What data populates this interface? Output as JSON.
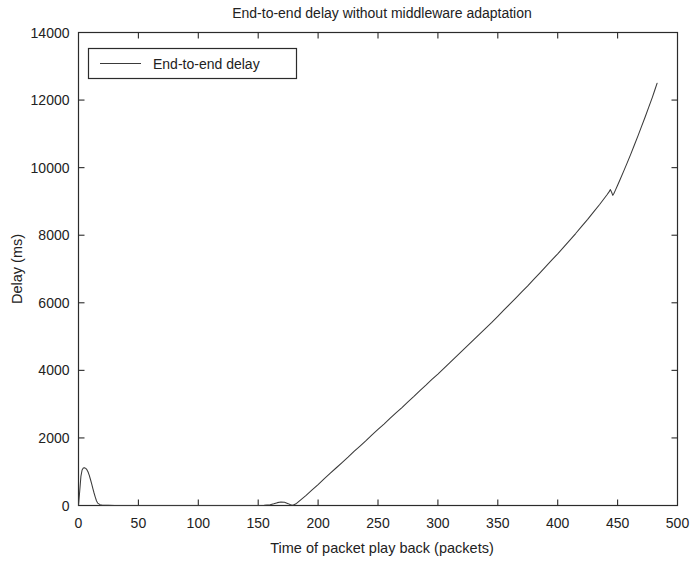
{
  "chart_data": {
    "type": "line",
    "title": "End-to-end delay without middleware adaptation",
    "xlabel": "Time of packet play back (packets)",
    "ylabel": "Delay (ms)",
    "xlim": [
      0,
      500
    ],
    "ylim": [
      0,
      14000
    ],
    "xticks": [
      0,
      50,
      100,
      150,
      200,
      250,
      300,
      350,
      400,
      450,
      500
    ],
    "yticks": [
      0,
      2000,
      4000,
      6000,
      8000,
      10000,
      12000,
      14000
    ],
    "xtick_labels": [
      "0",
      "50",
      "100",
      "150",
      "200",
      "250",
      "300",
      "350",
      "400",
      "450",
      "500"
    ],
    "ytick_labels": [
      "0",
      "2000",
      "4000",
      "6000",
      "8000",
      "10000",
      "12000",
      "14000"
    ],
    "grid": false,
    "legend_position": "upper left",
    "legend": [
      "End-to-end delay"
    ],
    "line_color": "#3a3a3a",
    "background_color": "#ffffff",
    "axis_color": "#2b2b2b",
    "series": [
      {
        "name": "End-to-end delay",
        "x": [
          0,
          1,
          2,
          3,
          4,
          5,
          6,
          7,
          8,
          9,
          10,
          11,
          12,
          13,
          14,
          15,
          16,
          18,
          20,
          25,
          30,
          40,
          50,
          60,
          70,
          80,
          90,
          100,
          110,
          120,
          130,
          140,
          150,
          155,
          160,
          163,
          166,
          169,
          172,
          175,
          177,
          179,
          182,
          186,
          190,
          195,
          200,
          205,
          210,
          215,
          220,
          225,
          230,
          235,
          240,
          245,
          250,
          255,
          260,
          265,
          270,
          275,
          280,
          285,
          290,
          295,
          300,
          305,
          310,
          315,
          320,
          325,
          330,
          335,
          340,
          345,
          350,
          355,
          360,
          365,
          370,
          375,
          380,
          385,
          390,
          395,
          400,
          405,
          410,
          415,
          420,
          425,
          430,
          435,
          438,
          441,
          443,
          444,
          445,
          446,
          447,
          448,
          450,
          452,
          455,
          458,
          461,
          464,
          467,
          470,
          473,
          476,
          479,
          481,
          483
        ],
        "y": [
          0,
          420,
          860,
          1050,
          1110,
          1120,
          1100,
          1060,
          990,
          890,
          770,
          640,
          500,
          370,
          250,
          140,
          70,
          25,
          10,
          4,
          2,
          1,
          1,
          1,
          1,
          1,
          1,
          1,
          1,
          1,
          1,
          2,
          3,
          6,
          20,
          50,
          85,
          105,
          95,
          55,
          20,
          10,
          60,
          180,
          300,
          460,
          620,
          790,
          950,
          1110,
          1270,
          1430,
          1600,
          1760,
          1920,
          2090,
          2250,
          2410,
          2580,
          2740,
          2900,
          3070,
          3230,
          3400,
          3560,
          3730,
          3890,
          4060,
          4230,
          4400,
          4570,
          4740,
          4910,
          5080,
          5250,
          5420,
          5600,
          5780,
          5960,
          6140,
          6320,
          6500,
          6690,
          6880,
          7070,
          7260,
          7450,
          7650,
          7850,
          8050,
          8260,
          8470,
          8690,
          8910,
          9050,
          9190,
          9290,
          9350,
          9270,
          9180,
          9240,
          9320,
          9480,
          9640,
          9890,
          10140,
          10400,
          10670,
          10940,
          11220,
          11500,
          11790,
          12080,
          12290,
          12500
        ]
      }
    ],
    "annotations": [
      "Initial transient spike peaking near 1120 ms around packet 5",
      "Near-zero delay plateau between packets 15 and 178",
      "Small bump of about 105 ms near packet 169",
      "Monotonic near-linear growth from packet 179 onward",
      "Local peak then dip notch near packet 445",
      "Final value about 13500 ms at packet 483"
    ]
  }
}
